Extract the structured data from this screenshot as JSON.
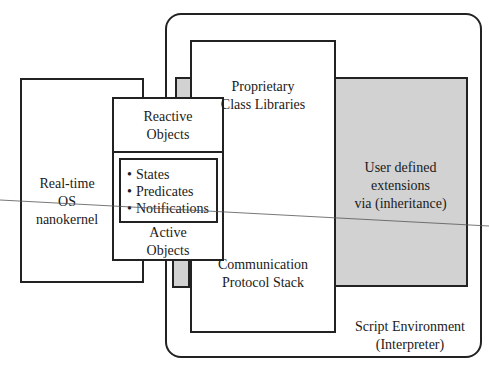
{
  "diagram": {
    "script_environment": {
      "line1": "Script Environment",
      "line2": "(Interpreter)"
    },
    "proprietary": {
      "line1": "Proprietary",
      "line2": "Class Libraries"
    },
    "communication": {
      "line1": "Communication",
      "line2": "Protocol Stack"
    },
    "user_defined": {
      "line1": "User defined",
      "line2": "extensions",
      "line3": "via (inheritance)"
    },
    "nanokernel": {
      "line1": "Real-time",
      "line2": "OS",
      "line3": "nanokernel"
    },
    "reactive": {
      "line1": "Reactive",
      "line2": "Objects"
    },
    "active": {
      "line1": "Active",
      "line2": "Objects"
    },
    "bullets": [
      "States",
      "Predicates",
      "Notifications"
    ],
    "colors": {
      "stroke": "#222222",
      "gray_fill": "#d2d2d2",
      "background": "#ffffff"
    }
  }
}
